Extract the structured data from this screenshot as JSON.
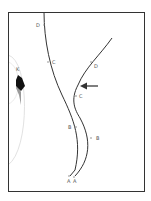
{
  "figure": {
    "type": "trajectory-diagram",
    "colors": {
      "frame": "#333333",
      "curve": "#333333",
      "arrow": "#555555",
      "marker_dark": "#111111",
      "marker_light": "#9a9a9a",
      "faint_arc": "#e2e2e2",
      "label": "#555555"
    },
    "left_curve": {
      "points": [
        {
          "label": "D"
        },
        {
          "label": "C"
        },
        {
          "label": "B"
        },
        {
          "label": "A"
        }
      ]
    },
    "right_curve": {
      "points": [
        {
          "label": "D"
        },
        {
          "label": "C"
        },
        {
          "label": "B"
        },
        {
          "label": "A"
        }
      ]
    },
    "object_label": "K",
    "arrow_direction": "left"
  }
}
